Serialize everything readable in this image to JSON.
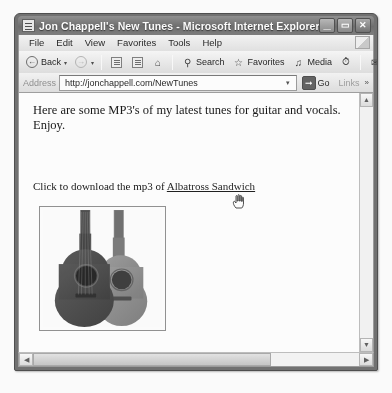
{
  "window": {
    "title": "Jon Chappell's New Tunes - Microsoft Internet Explorer",
    "icon": "ie-document-icon",
    "controls": {
      "minimize": "_",
      "maximize": "▭",
      "close": "✕"
    }
  },
  "menubar": {
    "items": [
      {
        "label": "File"
      },
      {
        "label": "Edit"
      },
      {
        "label": "View"
      },
      {
        "label": "Favorites"
      },
      {
        "label": "Tools"
      },
      {
        "label": "Help"
      }
    ]
  },
  "toolbar": {
    "back_label": "Back",
    "back_caret": "▾",
    "forward_caret": "▾",
    "search_label": "Search",
    "favorites_label": "Favorites",
    "media_label": "Media",
    "mail_caret": "▾",
    "print_caret": "▾"
  },
  "address": {
    "label": "Address",
    "value": "http://jonchappell.com/NewTunes",
    "placeholder": "http://",
    "dropdown_glyph": "▾",
    "go_label": "Go",
    "go_glyph": "➡",
    "links_label": "Links",
    "links_chevron": "»"
  },
  "page": {
    "paragraph": "Here are some MP3's of my latest tunes for guitar and vocals. Enjoy.",
    "link_prefix": "Click to download the mp3 of ",
    "link_text": "Albatross Sandwich",
    "image_alt": "two acoustic guitars"
  },
  "scrollbars": {
    "up_glyph": "▲",
    "down_glyph": "▼",
    "left_glyph": "◀",
    "right_glyph": "▶"
  },
  "colors": {
    "title_bar": "#6e6e6e",
    "toolbar": "#e9e9e9",
    "page_background": "#ffffff",
    "link": "#1a1a1a",
    "go_button": "#5f5f5f"
  }
}
